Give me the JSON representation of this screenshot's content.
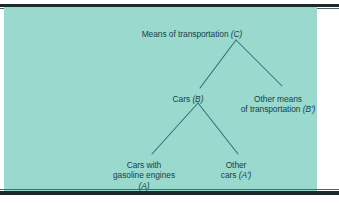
{
  "figure": {
    "type": "hierarchical-tree-diagram",
    "background_color": "#9ad9ce",
    "text_color": "#16424a",
    "line_color": "#2f6f72",
    "rule_color": "#1d2a2b"
  },
  "tree": {
    "root": {
      "id": "C",
      "label": "Means of transportation (C)",
      "text": "Means of transportation ",
      "symbol": "(C)"
    },
    "level2": [
      {
        "id": "B",
        "label": "Cars (B)",
        "text": "Cars ",
        "symbol": "(B)"
      },
      {
        "id": "B-prime",
        "label": "Other means of transportation (B')",
        "line1": "Other means",
        "line2": "of transportation ",
        "symbol": "(B')"
      }
    ],
    "level3": [
      {
        "id": "A",
        "label": "Cars with gasoline engines (A)",
        "line1": "Cars with",
        "line2": "gasoline engines",
        "symbol": "(A)"
      },
      {
        "id": "A-prime",
        "label": "Other cars (A')",
        "line1": "Other",
        "line2": "cars ",
        "symbol": "(A')"
      }
    ]
  },
  "edges": [
    {
      "name": "edge-root-to-cars",
      "from": "C",
      "to": "B"
    },
    {
      "name": "edge-root-to-other",
      "from": "C",
      "to": "B-prime"
    },
    {
      "name": "edge-cars-to-gasoline",
      "from": "B",
      "to": "A"
    },
    {
      "name": "edge-cars-to-othercars",
      "from": "B",
      "to": "A-prime"
    }
  ]
}
